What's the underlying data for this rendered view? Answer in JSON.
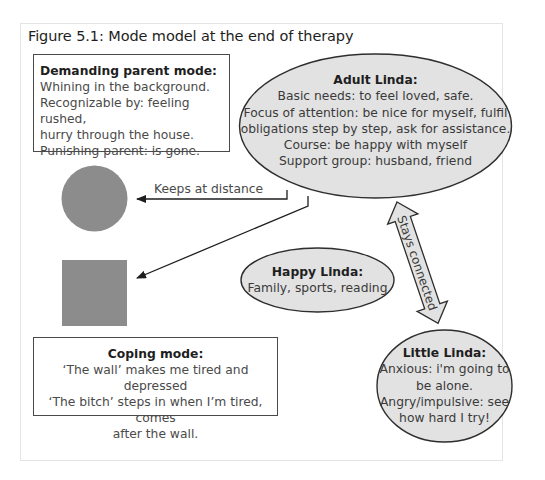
{
  "figure": {
    "title": "Figure 5.1: Mode model at the end of therapy"
  },
  "demanding_parent": {
    "header": "Demanding parent mode:",
    "lines": [
      "Whining in the background.",
      "Recognizable by: feeling rushed,",
      "hurry through the house.",
      "Punishing parent: is gone."
    ]
  },
  "adult_linda": {
    "header": "Adult Linda:",
    "lines": [
      "Basic needs: to feel loved, safe.",
      "Focus of attention: be nice for myself, fulfil",
      "obligations step by step, ask for assistance.",
      "Course: be happy with myself",
      "Support group: husband, friend"
    ],
    "fill": "#e2e2e2"
  },
  "happy_linda": {
    "header": "Happy Linda:",
    "lines": [
      "Family, sports, reading"
    ],
    "fill": "#e2e2e2"
  },
  "little_linda": {
    "header": "Little Linda:",
    "lines": [
      "Anxious: i'm going to",
      "be alone.",
      "Angry/impulsive: see",
      "how hard I try!"
    ],
    "fill": "#e2e2e2"
  },
  "coping_mode": {
    "header": "Coping mode:",
    "lines": [
      "‘The wall’ makes me tired and depressed",
      "‘The bitch’ steps in when I’m tired, comes",
      "after the wall."
    ]
  },
  "shapes": {
    "circle_fill": "#8c8c8c",
    "square_fill": "#8c8c8c"
  },
  "connectors": {
    "keeps_at_distance": "Keeps at distance",
    "stays_connected": "Stays connected"
  }
}
